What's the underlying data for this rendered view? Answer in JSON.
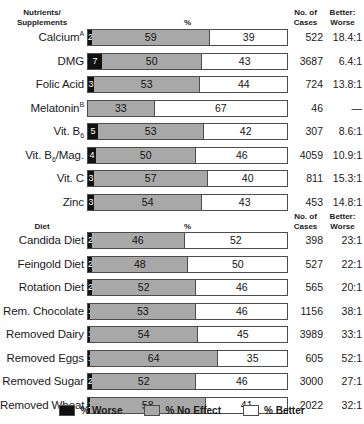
{
  "chart_data": {
    "type": "bar",
    "title": "",
    "subtype": "stacked-horizontal-100pct",
    "xlabel": "%",
    "ylabel": "",
    "xlim": [
      0,
      100
    ],
    "grid": false,
    "legend_position": "bottom",
    "legend": [
      "% Worse",
      "% No Effect",
      "% Better"
    ],
    "series": [
      {
        "name": "% Worse",
        "color": "#111111"
      },
      {
        "name": "% No Effect",
        "color": "#a8a8a8"
      },
      {
        "name": "% Better",
        "color": "#ffffff"
      }
    ],
    "sections": [
      {
        "category_header": "Nutrients/ Supplements",
        "categories": [
          "Calcium",
          "DMG",
          "Folic Acid",
          "Melatonin",
          "Vit. B6",
          "Vit. B6/Mag.",
          "Vit. C",
          "Zinc"
        ],
        "worse": [
          2,
          7,
          3,
          0,
          5,
          4,
          3,
          3
        ],
        "no_effect": [
          59,
          50,
          53,
          33,
          53,
          50,
          57,
          54
        ],
        "better": [
          39,
          43,
          44,
          67,
          42,
          46,
          40,
          43
        ],
        "cases": [
          522,
          3687,
          724,
          46,
          307,
          4059,
          811,
          453
        ],
        "ratio": [
          "18.4:1",
          "6.4:1",
          "13.8:1",
          "—",
          "8.6:1",
          "10.9:1",
          "15.3:1",
          "14.8:1"
        ]
      },
      {
        "category_header": "Diet",
        "categories": [
          "Candida Diet",
          "Feingold Diet",
          "Rotation Diet",
          "Rem. Chocolate",
          "Removed Dairy",
          "Removed Eggs",
          "Removed Sugar",
          "Removed Wheat"
        ],
        "worse": [
          2,
          2,
          2,
          1,
          1,
          1,
          2,
          1
        ],
        "no_effect": [
          46,
          48,
          52,
          53,
          54,
          64,
          52,
          58
        ],
        "better": [
          52,
          50,
          46,
          46,
          45,
          35,
          46,
          41
        ],
        "cases": [
          398,
          527,
          565,
          1156,
          3989,
          605,
          3000,
          2022
        ],
        "ratio": [
          "23:1",
          "22:1",
          "20:1",
          "38:1",
          "33:1",
          "52:1",
          "27:1",
          "32:1"
        ]
      }
    ]
  },
  "section1": {
    "header": {
      "cat_line1": "Nutrients/",
      "cat_line2": "Supplements",
      "pct": "%",
      "cases_line1": "No. of",
      "cases_line2": "Cases",
      "ratio_line1": "Better:",
      "ratio_line2": "Worse"
    },
    "rows": [
      {
        "label": "Calcium",
        "sup": "A",
        "sub": "",
        "worse": "2",
        "no_effect": "59",
        "better": "39",
        "cases": "522",
        "ratio": "18.4:1"
      },
      {
        "label": "DMG",
        "sup": "",
        "sub": "",
        "worse": "7",
        "no_effect": "50",
        "better": "43",
        "cases": "3687",
        "ratio": "6.4:1"
      },
      {
        "label": "Folic Acid",
        "sup": "",
        "sub": "",
        "worse": "3",
        "no_effect": "53",
        "better": "44",
        "cases": "724",
        "ratio": "13.8:1"
      },
      {
        "label": "Melatonin",
        "sup": "B",
        "sub": "",
        "worse": "",
        "no_effect": "33",
        "better": "67",
        "cases": "46",
        "ratio": "—"
      },
      {
        "label": "Vit. B",
        "sup": "",
        "sub": "6",
        "worse": "5",
        "no_effect": "53",
        "better": "42",
        "cases": "307",
        "ratio": "8.6:1"
      },
      {
        "label": "Vit. B",
        "sup": "",
        "sub": "6",
        "suffix": "/Mag.",
        "worse": "4",
        "no_effect": "50",
        "better": "46",
        "cases": "4059",
        "ratio": "10.9:1"
      },
      {
        "label": "Vit. C",
        "sup": "",
        "sub": "",
        "worse": "3",
        "no_effect": "57",
        "better": "40",
        "cases": "811",
        "ratio": "15.3:1"
      },
      {
        "label": "Zinc",
        "sup": "",
        "sub": "",
        "worse": "3",
        "no_effect": "54",
        "better": "43",
        "cases": "453",
        "ratio": "14.8:1"
      }
    ]
  },
  "section2": {
    "header": {
      "cat_line1": "Diet",
      "cat_line2": "",
      "pct": "%",
      "cases_line1": "No. of",
      "cases_line2": "Cases",
      "ratio_line1": "Better:",
      "ratio_line2": "Worse"
    },
    "rows": [
      {
        "label": "Candida Diet",
        "worse": "2",
        "no_effect": "46",
        "better": "52",
        "cases": "398",
        "ratio": "23:1"
      },
      {
        "label": "Feingold Diet",
        "worse": "2",
        "no_effect": "48",
        "better": "50",
        "cases": "527",
        "ratio": "22:1"
      },
      {
        "label": "Rotation Diet",
        "worse": "2",
        "no_effect": "52",
        "better": "46",
        "cases": "565",
        "ratio": "20:1"
      },
      {
        "label": "Rem. Chocolate",
        "worse": "1",
        "no_effect": "53",
        "better": "46",
        "cases": "1156",
        "ratio": "38:1"
      },
      {
        "label": "Removed Dairy",
        "worse": "1",
        "no_effect": "54",
        "better": "45",
        "cases": "3989",
        "ratio": "33:1"
      },
      {
        "label": "Removed Eggs",
        "worse": "1",
        "no_effect": "64",
        "better": "35",
        "cases": "605",
        "ratio": "52:1"
      },
      {
        "label": "Removed Sugar",
        "worse": "2",
        "no_effect": "52",
        "better": "46",
        "cases": "3000",
        "ratio": "27:1"
      },
      {
        "label": "Removed Wheat",
        "worse": "1",
        "no_effect": "58",
        "better": "41",
        "cases": "2022",
        "ratio": "32:1"
      }
    ]
  },
  "legend": {
    "worse": "% Worse",
    "no_effect": "% No Effect",
    "better": "% Better"
  },
  "colors": {
    "worse": "#111111",
    "no_effect": "#a8a8a8",
    "better": "#ffffff",
    "border": "#4d4d4d",
    "text": "#1a1a1a"
  }
}
